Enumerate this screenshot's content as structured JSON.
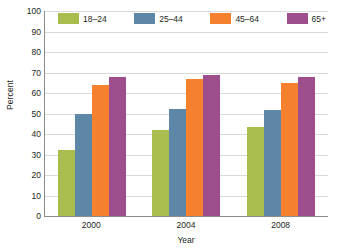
{
  "chart_data": {
    "type": "bar",
    "title": "",
    "xlabel": "Year",
    "ylabel": "Percent",
    "categories": [
      "2000",
      "2004",
      "2008"
    ],
    "series": [
      {
        "name": "18–24",
        "color": "#a9bd4f",
        "values": [
          32,
          42,
          43.5
        ]
      },
      {
        "name": "25–44",
        "color": "#5c87a6",
        "values": [
          50,
          52,
          51.5
        ]
      },
      {
        "name": "45–64",
        "color": "#f5812f",
        "values": [
          64,
          67,
          65
        ]
      },
      {
        "name": "65+",
        "color": "#9e4e8d",
        "values": [
          68,
          69,
          68
        ]
      }
    ],
    "ylim": [
      0,
      100
    ],
    "ytick_step": 10,
    "yticks": [
      "0",
      "10",
      "20",
      "30",
      "40",
      "50",
      "60",
      "70",
      "80",
      "90",
      "100"
    ],
    "grid": true,
    "legend_position": "top-inside"
  },
  "axes": {
    "y_title": "Percent",
    "x_title": "Year"
  }
}
